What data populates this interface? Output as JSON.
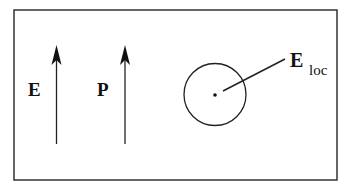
{
  "diagram": {
    "labels": {
      "field": "E",
      "polarization": "P",
      "local_field_main": "E",
      "local_field_sub": "loc"
    },
    "colors": {
      "stroke": "#222222",
      "background": "#ffffff"
    }
  }
}
